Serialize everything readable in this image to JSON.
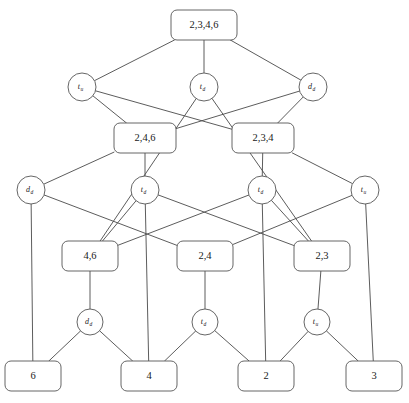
{
  "diagram": {
    "kind": "concept-lattice",
    "title": "",
    "colors": {
      "background": "#ffffff",
      "node_stroke": "#555555",
      "edge_stroke": "#4a4a4a",
      "text": "#1a1a1a"
    },
    "box_nodes": [
      {
        "id": "b0",
        "label": "2,3,4,6",
        "x": 204,
        "y": 25,
        "w": 66,
        "h": 30
      },
      {
        "id": "b1",
        "label": "2,4,6",
        "x": 145,
        "y": 138,
        "w": 62,
        "h": 30
      },
      {
        "id": "b2",
        "label": "2,3,4",
        "x": 263,
        "y": 138,
        "w": 62,
        "h": 30
      },
      {
        "id": "b3",
        "label": "4,6",
        "x": 90,
        "y": 256,
        "w": 56,
        "h": 30
      },
      {
        "id": "b4",
        "label": "2,4",
        "x": 205,
        "y": 256,
        "w": 56,
        "h": 30
      },
      {
        "id": "b5",
        "label": "2,3",
        "x": 322,
        "y": 256,
        "w": 56,
        "h": 30
      },
      {
        "id": "b6",
        "label": "6",
        "x": 33,
        "y": 376,
        "w": 56,
        "h": 30
      },
      {
        "id": "b7",
        "label": "4",
        "x": 149,
        "y": 376,
        "w": 56,
        "h": 30
      },
      {
        "id": "b8",
        "label": "2",
        "x": 266,
        "y": 376,
        "w": 56,
        "h": 30
      },
      {
        "id": "b9",
        "label": "3",
        "x": 374,
        "y": 376,
        "w": 56,
        "h": 30
      }
    ],
    "circle_nodes": [
      {
        "id": "c0",
        "base": "t",
        "sub": "u",
        "x": 82,
        "y": 87,
        "r": 14
      },
      {
        "id": "c1",
        "base": "t",
        "sub": "d",
        "x": 204,
        "y": 87,
        "r": 14
      },
      {
        "id": "c2",
        "base": "d",
        "sub": "d",
        "x": 313,
        "y": 87,
        "r": 14
      },
      {
        "id": "c3",
        "base": "d",
        "sub": "d",
        "x": 31,
        "y": 190,
        "r": 14
      },
      {
        "id": "c4",
        "base": "t",
        "sub": "d",
        "x": 145,
        "y": 190,
        "r": 14
      },
      {
        "id": "c5",
        "base": "t",
        "sub": "d",
        "x": 262,
        "y": 190,
        "r": 14
      },
      {
        "id": "c6",
        "base": "t",
        "sub": "u",
        "x": 365,
        "y": 190,
        "r": 14
      },
      {
        "id": "c7",
        "base": "d",
        "sub": "d",
        "x": 90,
        "y": 322,
        "r": 13
      },
      {
        "id": "c8",
        "base": "t",
        "sub": "d",
        "x": 205,
        "y": 322,
        "r": 13
      },
      {
        "id": "c9",
        "base": "t",
        "sub": "u",
        "x": 317,
        "y": 322,
        "r": 13
      }
    ],
    "edges": [
      {
        "from": "b0",
        "to": "c0"
      },
      {
        "from": "b0",
        "to": "c1"
      },
      {
        "from": "b0",
        "to": "c2"
      },
      {
        "from": "c0",
        "to": "b1"
      },
      {
        "from": "c0",
        "to": "b2"
      },
      {
        "from": "c2",
        "to": "b1"
      },
      {
        "from": "c2",
        "to": "b2"
      },
      {
        "from": "c1",
        "to": "b3"
      },
      {
        "from": "c1",
        "to": "b5"
      },
      {
        "from": "b1",
        "to": "c3"
      },
      {
        "from": "b1",
        "to": "c4"
      },
      {
        "from": "b2",
        "to": "c5"
      },
      {
        "from": "b2",
        "to": "c6"
      },
      {
        "from": "c3",
        "to": "b4"
      },
      {
        "from": "c4",
        "to": "b3"
      },
      {
        "from": "c4",
        "to": "b5"
      },
      {
        "from": "c5",
        "to": "b3"
      },
      {
        "from": "c5",
        "to": "b5"
      },
      {
        "from": "c6",
        "to": "b4"
      },
      {
        "from": "c3",
        "to": "b6"
      },
      {
        "from": "c6",
        "to": "b9"
      },
      {
        "from": "b3",
        "to": "c7"
      },
      {
        "from": "b4",
        "to": "c8"
      },
      {
        "from": "b5",
        "to": "c9"
      },
      {
        "from": "c4",
        "to": "b7"
      },
      {
        "from": "c5",
        "to": "b8"
      },
      {
        "from": "c7",
        "to": "b6"
      },
      {
        "from": "c7",
        "to": "b7"
      },
      {
        "from": "c8",
        "to": "b7"
      },
      {
        "from": "c8",
        "to": "b8"
      },
      {
        "from": "c9",
        "to": "b8"
      },
      {
        "from": "c9",
        "to": "b9"
      }
    ]
  }
}
